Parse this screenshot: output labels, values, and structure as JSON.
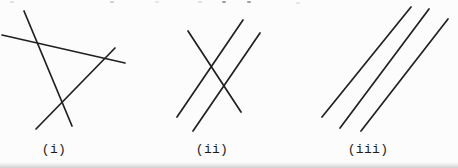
{
  "page": {
    "background": "#fcfcfc",
    "kind": "scanned textbook figure of line arrangements"
  },
  "styles": {
    "line_color": "#202020",
    "line_width": 1.7,
    "label_color": "#1b1b1b"
  },
  "figures": [
    {
      "id": "figure-i",
      "label": "(i)",
      "depicts": "three lines intersecting pairwise, enclosing a triangle",
      "lines": [
        {
          "x1": 2,
          "y1": 35,
          "x2": 125,
          "y2": 63
        },
        {
          "x1": 24,
          "y1": 11,
          "x2": 72,
          "y2": 126
        },
        {
          "x1": 36,
          "y1": 129,
          "x2": 115,
          "y2": 48
        }
      ]
    },
    {
      "id": "figure-ii",
      "label": "(ii)",
      "depicts": "two parallel lines crossed by a transversal",
      "lines": [
        {
          "x1": 188,
          "y1": 31,
          "x2": 241,
          "y2": 112
        },
        {
          "x1": 243,
          "y1": 20,
          "x2": 177,
          "y2": 117
        },
        {
          "x1": 260,
          "y1": 33,
          "x2": 193,
          "y2": 131
        }
      ]
    },
    {
      "id": "figure-iii",
      "label": "(iii)",
      "depicts": "three parallel lines",
      "lines": [
        {
          "x1": 322,
          "y1": 117,
          "x2": 411,
          "y2": 7
        },
        {
          "x1": 340,
          "y1": 128,
          "x2": 429,
          "y2": 9
        },
        {
          "x1": 361,
          "y1": 131,
          "x2": 448,
          "y2": 19
        }
      ]
    }
  ]
}
